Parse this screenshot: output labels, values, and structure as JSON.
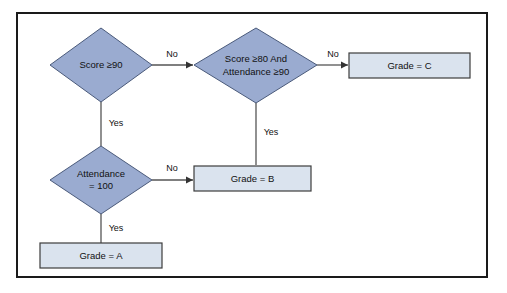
{
  "diagram": {
    "colors": {
      "decision_fill": "#9aabd0",
      "decision_stroke": "#4a5a7a",
      "process_fill": "#dae3ee",
      "process_stroke": "#3c3c3c",
      "connector": "#555555",
      "frame_border": "#1a1a1a",
      "background": "#ffffff",
      "text": "#111111"
    },
    "nodes": [
      {
        "id": "score90",
        "type": "decision",
        "lines": [
          "Score ≥90"
        ]
      },
      {
        "id": "score80",
        "type": "decision",
        "lines": [
          "Score ≥80 And",
          "Attendance ≥90"
        ]
      },
      {
        "id": "attendance100",
        "type": "decision",
        "lines": [
          "Attendance",
          "= 100"
        ]
      },
      {
        "id": "gradeC",
        "type": "process",
        "lines": [
          "Grade = C"
        ]
      },
      {
        "id": "gradeB",
        "type": "process",
        "lines": [
          "Grade = B"
        ]
      },
      {
        "id": "gradeA",
        "type": "process",
        "lines": [
          "Grade = A"
        ]
      }
    ],
    "edges": [
      {
        "id": "score90-no",
        "from": "score90",
        "to": "score80",
        "label": "No"
      },
      {
        "id": "score90-yes",
        "from": "score90",
        "to": "attendance100",
        "label": "Yes"
      },
      {
        "id": "score80-no",
        "from": "score80",
        "to": "gradeC",
        "label": "No"
      },
      {
        "id": "score80-yes",
        "from": "score80",
        "to": "gradeB",
        "label": "Yes"
      },
      {
        "id": "attendance100-no",
        "from": "attendance100",
        "to": "gradeB",
        "label": "No"
      },
      {
        "id": "attendance100-yes",
        "from": "attendance100",
        "to": "gradeA",
        "label": "Yes"
      }
    ]
  }
}
